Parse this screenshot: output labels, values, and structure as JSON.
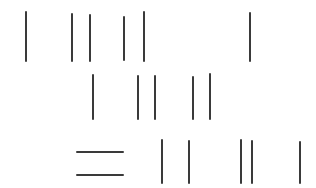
{
  "canvas": {
    "width": 316,
    "height": 188,
    "background_color": "#ffffff",
    "stroke_color": "#3a3a3a",
    "stroke_thickness": 2,
    "description": "Hand-drawn pen strokes arranged in three rows on a blank white page"
  },
  "rows": [
    {
      "id": "row-1",
      "label": "top-row",
      "strokes": [
        {
          "orientation": "vertical",
          "x": 25,
          "y1": 11,
          "y2": 62
        },
        {
          "orientation": "vertical",
          "x": 71,
          "y1": 13,
          "y2": 62
        },
        {
          "orientation": "vertical",
          "x": 89,
          "y1": 14,
          "y2": 62
        },
        {
          "orientation": "vertical",
          "x": 123,
          "y1": 16,
          "y2": 61
        },
        {
          "orientation": "vertical",
          "x": 143,
          "y1": 11,
          "y2": 62
        },
        {
          "orientation": "vertical",
          "x": 249,
          "y1": 12,
          "y2": 62
        }
      ]
    },
    {
      "id": "row-2",
      "label": "middle-row",
      "strokes": [
        {
          "orientation": "vertical",
          "x": 92,
          "y1": 74,
          "y2": 120
        },
        {
          "orientation": "vertical",
          "x": 137,
          "y1": 75,
          "y2": 120
        },
        {
          "orientation": "vertical",
          "x": 154,
          "y1": 75,
          "y2": 120
        },
        {
          "orientation": "vertical",
          "x": 192,
          "y1": 76,
          "y2": 120
        },
        {
          "orientation": "vertical",
          "x": 209,
          "y1": 73,
          "y2": 120
        }
      ]
    },
    {
      "id": "row-3",
      "label": "bottom-row",
      "strokes": [
        {
          "orientation": "horizontal",
          "y": 151,
          "x1": 76,
          "x2": 124
        },
        {
          "orientation": "horizontal",
          "y": 174,
          "x1": 76,
          "x2": 124
        },
        {
          "orientation": "vertical",
          "x": 161,
          "y1": 139,
          "y2": 184
        },
        {
          "orientation": "vertical",
          "x": 188,
          "y1": 140,
          "y2": 184
        },
        {
          "orientation": "vertical",
          "x": 240,
          "y1": 139,
          "y2": 184
        },
        {
          "orientation": "vertical",
          "x": 251,
          "y1": 140,
          "y2": 184
        },
        {
          "orientation": "vertical",
          "x": 299,
          "y1": 141,
          "y2": 184
        }
      ]
    }
  ]
}
